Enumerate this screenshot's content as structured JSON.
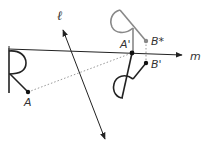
{
  "diagram": {
    "colors": {
      "stroke": "#222222",
      "gray": "#888888",
      "dotted": "#999999",
      "label": "#333333"
    },
    "lines": {
      "m": {
        "label": "m",
        "x1": 8,
        "y1": 49,
        "x2": 182,
        "y2": 55
      },
      "l": {
        "label": "ℓ",
        "x1": 62,
        "y1": 27,
        "x2": 106,
        "y2": 141
      }
    },
    "points": {
      "A": {
        "label": "A",
        "x": 28,
        "y": 92
      },
      "A_prime": {
        "label": "A'",
        "x": 132,
        "y": 53
      },
      "B_star": {
        "label": "B*",
        "x": 146,
        "y": 41
      },
      "B_prime": {
        "label": "B'",
        "x": 146,
        "y": 63
      }
    },
    "labels": {
      "m": "m",
      "l": "ℓ",
      "A": "A",
      "A_prime": "A'",
      "B_star": "B*",
      "B_prime": "B'"
    }
  }
}
